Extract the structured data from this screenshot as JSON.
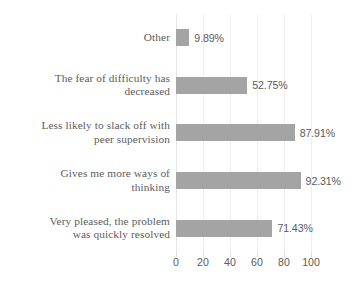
{
  "chart_data": {
    "type": "bar",
    "orientation": "horizontal",
    "title": "",
    "xlabel": "",
    "ylabel": "",
    "xlim": [
      0,
      100
    ],
    "xticks": [
      0,
      20,
      40,
      60,
      80,
      100
    ],
    "xtick_labels": [
      "0",
      "20",
      "40",
      "60",
      "80",
      "100"
    ],
    "grid": true,
    "legend": "none",
    "bar_color": "#a4a4a4",
    "text_color": "#5a5a5a",
    "background": "#ffffff",
    "categories": [
      "Other",
      "The fear of difficulty has decreased",
      "Less likely to slack off with peer supervision",
      "Gives me more ways of thinking",
      "Very pleased, the problem was quickly resolved"
    ],
    "values": [
      9.89,
      52.75,
      87.91,
      92.31,
      71.43
    ],
    "data_labels": [
      "9.89%",
      "52.75%",
      "87.91%",
      "92.31%",
      "71.43%"
    ],
    "rows": [
      {
        "label_line1": "Other",
        "label_line2": "",
        "value": 9.89,
        "data_label": "9.89%"
      },
      {
        "label_line1": "The fear of difficulty has",
        "label_line2": "decreased",
        "value": 52.75,
        "data_label": "52.75%"
      },
      {
        "label_line1": "Less likely to slack off with",
        "label_line2": "peer supervision",
        "value": 87.91,
        "data_label": "87.91%"
      },
      {
        "label_line1": "Gives me more ways of",
        "label_line2": "thinking",
        "value": 92.31,
        "data_label": "92.31%"
      },
      {
        "label_line1": "Very pleased, the problem",
        "label_line2": "was quickly resolved",
        "value": 71.43,
        "data_label": "71.43%"
      }
    ]
  }
}
